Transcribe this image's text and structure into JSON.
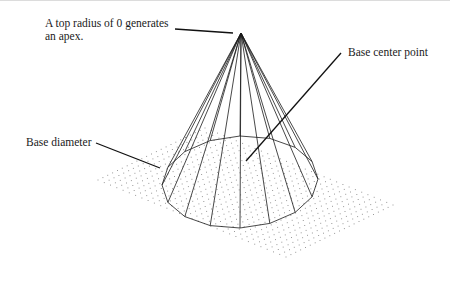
{
  "diagram": {
    "type": "cone-wireframe",
    "labels": {
      "apex_line1": "A top radius of 0 generates",
      "apex_line2": "an apex.",
      "base_center": "Base center point",
      "base_diameter": "Base diameter"
    },
    "colors": {
      "line": "#1a1a1a",
      "grid_dot": "#9a9a9a",
      "background": "#ffffff"
    }
  }
}
